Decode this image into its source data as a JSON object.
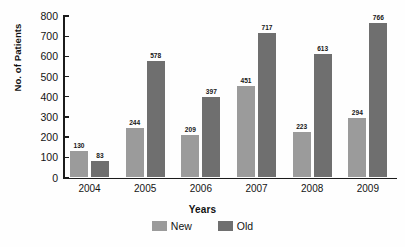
{
  "chart_data": {
    "type": "bar",
    "title": "",
    "xlabel": "Years",
    "ylabel": "No. of Patients",
    "categories": [
      "2004",
      "2005",
      "2006",
      "2007",
      "2008",
      "2009"
    ],
    "series": [
      {
        "name": "New",
        "color": "#9b9b9b",
        "values": [
          130,
          244,
          209,
          451,
          223,
          294
        ]
      },
      {
        "name": "Old",
        "color": "#6f6f6f",
        "values": [
          83,
          578,
          397,
          717,
          613,
          766
        ]
      }
    ],
    "ylim": [
      0,
      800
    ],
    "yticks": [
      0,
      100,
      200,
      300,
      400,
      500,
      600,
      700,
      800
    ],
    "ytick_labels": [
      "0",
      "100",
      "200",
      "300",
      "400",
      "500",
      "600",
      "700",
      "800"
    ],
    "grid": false,
    "legend_position": "bottom-center",
    "data_labels": true
  },
  "legend": {
    "entries": [
      {
        "label": "New",
        "color": "#9b9b9b"
      },
      {
        "label": "Old",
        "color": "#6f6f6f"
      }
    ]
  },
  "colors": {
    "new_bar": "#9b9b9b",
    "old_bar": "#6f6f6f",
    "axis": "#1b1b1b",
    "text": "#141414",
    "background": "#fefefe"
  }
}
